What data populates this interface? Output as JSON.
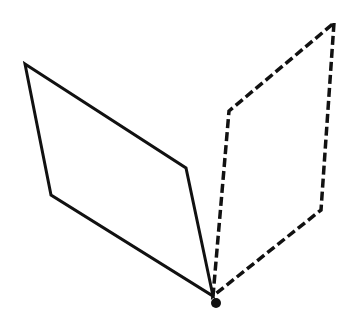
{
  "diagram": {
    "width": 357,
    "height": 330,
    "background": "#ffffff",
    "stroke_color": "#111111",
    "solid_plane": {
      "points": "25,64 186,168 213,296 51,195",
      "stroke_width": 3,
      "style": "solid"
    },
    "dashed_plane": {
      "points": "334,23 321,210 213,296 229,111",
      "stroke_width": 3.5,
      "dasharray": "9,4",
      "style": "dashed"
    },
    "vertex_point": {
      "cx": 216,
      "cy": 303,
      "r": 5
    }
  }
}
